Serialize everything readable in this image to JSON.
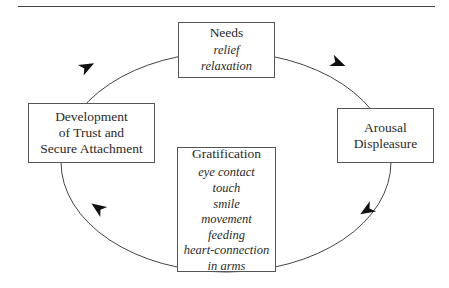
{
  "diagram": {
    "type": "cycle",
    "direction": "clockwise",
    "nodes": [
      {
        "id": "needs",
        "title": "Needs",
        "items": [
          "relief",
          "relaxation"
        ]
      },
      {
        "id": "arousal",
        "title": "Arousal\nDispleasure",
        "items": []
      },
      {
        "id": "gratification",
        "title": "Gratification",
        "items": [
          "eye contact",
          "touch",
          "smile",
          "movement",
          "feeding",
          "heart-connection",
          "in arms"
        ]
      },
      {
        "id": "trust",
        "title": "Development\nof Trust and\nSecure Attachment",
        "items": []
      }
    ],
    "edges": [
      {
        "from": "needs",
        "to": "arousal"
      },
      {
        "from": "arousal",
        "to": "gratification"
      },
      {
        "from": "gratification",
        "to": "trust"
      },
      {
        "from": "trust",
        "to": "needs"
      }
    ]
  },
  "colors": {
    "line": "#444444",
    "arrow": "#111111",
    "box_border": "#555555",
    "text": "#2a2a2a",
    "background": "#ffffff"
  }
}
